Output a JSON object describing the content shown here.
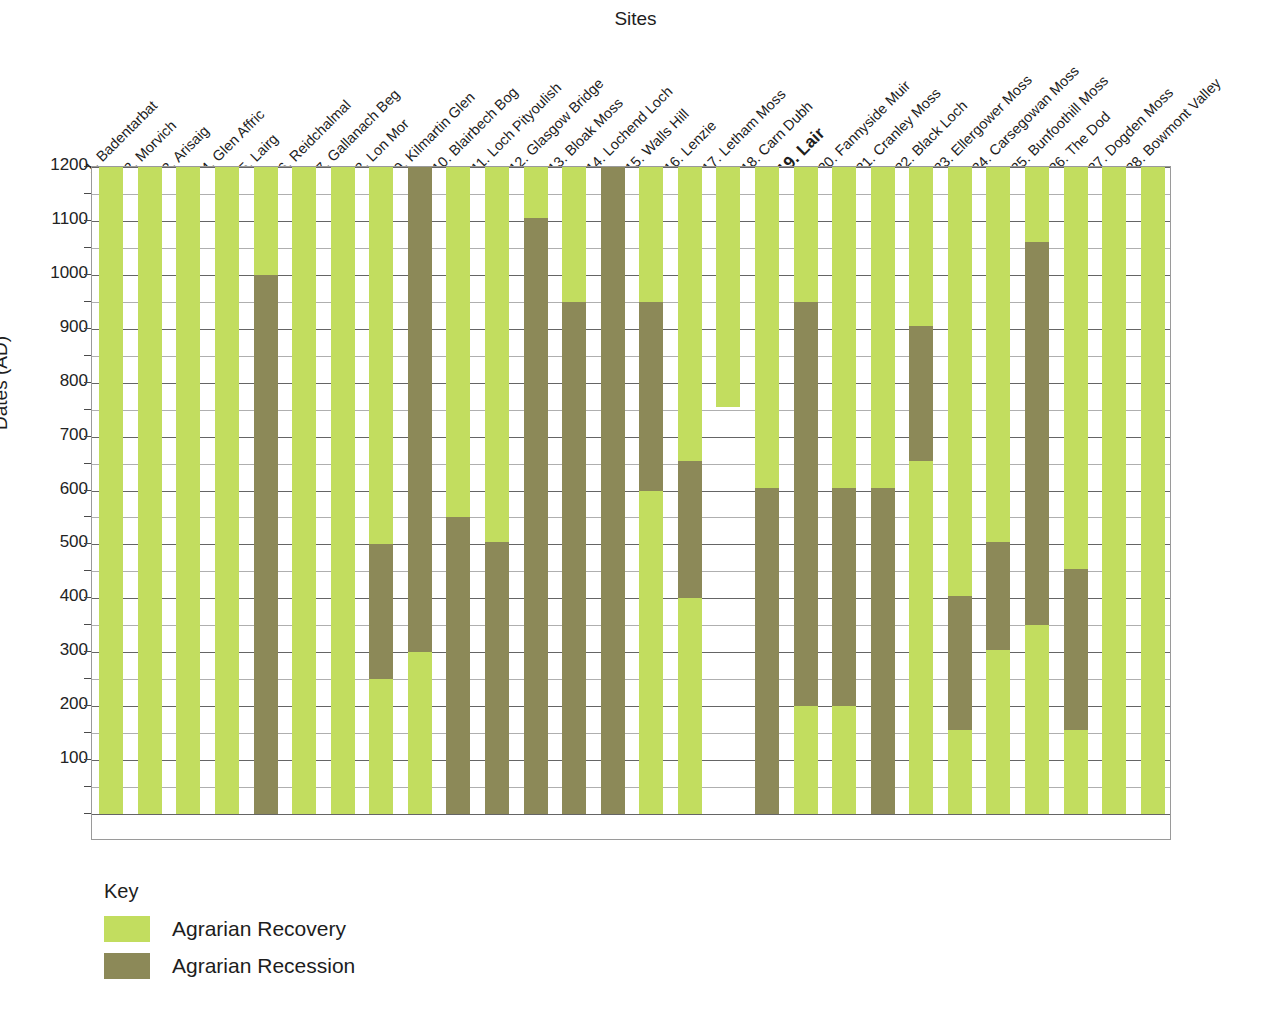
{
  "chart_data": {
    "type": "bar",
    "title": "Sites",
    "xlabel": "Sites",
    "ylabel": "Dates (AD)",
    "ylim": [
      0,
      1200
    ],
    "y_major_ticks": [
      1200,
      1100,
      1000,
      900,
      800,
      700,
      600,
      500,
      400,
      300,
      200,
      100
    ],
    "y_minor_step": 50,
    "grid": true,
    "legend_position": "below-plot-left",
    "colors": {
      "recovery": "#c2dd5f",
      "recession": "#8c8958"
    },
    "categories": [
      "1. Badentarbat",
      "2. Morvich",
      "3. Arisaig",
      "4. Glen Affric",
      "5. Lairg",
      "6. Reidchalmal",
      "7. Gallanach Beg",
      "8. Lon Mor",
      "9. Kilmartin Glen",
      "10. Blairbech Bog",
      "11. Loch Pityoulish",
      "12. Glasgow Bridge",
      "13. Bloak Moss",
      "14. Lochend Loch",
      "15. Walls Hill",
      "16. Lenzie",
      "17. Letham Moss",
      "18. Carn Dubh",
      "19. Lair",
      "20. Fannyside Muir",
      "21. Cranley Moss",
      "22. Black Loch",
      "23. Ellergower Moss",
      "24. Carsegowan Moss",
      "25. Bunfoothill Moss",
      "26. The Dod",
      "27. Dogden Moss",
      "28. Bowmont Valley"
    ],
    "highlighted_category": "19. Lair",
    "series": [
      {
        "name": "Agrarian Recovery",
        "color": "#c2dd5f"
      },
      {
        "name": "Agrarian Recession",
        "color": "#8c8958"
      }
    ],
    "bars": [
      {
        "site": "1. Badentarbat",
        "segments": [
          {
            "type": "recovery",
            "from": 0,
            "to": 1200
          }
        ]
      },
      {
        "site": "2. Morvich",
        "segments": [
          {
            "type": "recovery",
            "from": 0,
            "to": 1200
          }
        ]
      },
      {
        "site": "3. Arisaig",
        "segments": [
          {
            "type": "recovery",
            "from": 0,
            "to": 1200
          }
        ]
      },
      {
        "site": "4. Glen Affric",
        "segments": [
          {
            "type": "recovery",
            "from": 0,
            "to": 1200
          }
        ]
      },
      {
        "site": "5. Lairg",
        "segments": [
          {
            "type": "recession",
            "from": 0,
            "to": 1000
          },
          {
            "type": "recovery",
            "from": 1000,
            "to": 1200
          }
        ]
      },
      {
        "site": "6. Reidchalmal",
        "segments": [
          {
            "type": "recovery",
            "from": 0,
            "to": 1200
          }
        ]
      },
      {
        "site": "7. Gallanach Beg",
        "segments": [
          {
            "type": "recovery",
            "from": 0,
            "to": 1200
          }
        ]
      },
      {
        "site": "8. Lon Mor",
        "segments": [
          {
            "type": "recovery",
            "from": 0,
            "to": 250
          },
          {
            "type": "recession",
            "from": 250,
            "to": 500
          },
          {
            "type": "recovery",
            "from": 500,
            "to": 1200
          }
        ]
      },
      {
        "site": "9. Kilmartin Glen",
        "segments": [
          {
            "type": "recovery",
            "from": 0,
            "to": 300
          },
          {
            "type": "recession",
            "from": 300,
            "to": 1200
          }
        ]
      },
      {
        "site": "10. Blairbech Bog",
        "segments": [
          {
            "type": "recession",
            "from": 0,
            "to": 550
          },
          {
            "type": "recovery",
            "from": 550,
            "to": 1200
          }
        ]
      },
      {
        "site": "11. Loch Pityoulish",
        "segments": [
          {
            "type": "recession",
            "from": 0,
            "to": 505
          },
          {
            "type": "recovery",
            "from": 505,
            "to": 1200
          }
        ]
      },
      {
        "site": "12. Glasgow Bridge",
        "segments": [
          {
            "type": "recession",
            "from": 0,
            "to": 1105
          },
          {
            "type": "recovery",
            "from": 1105,
            "to": 1200
          }
        ]
      },
      {
        "site": "13. Bloak Moss",
        "segments": [
          {
            "type": "recession",
            "from": 0,
            "to": 950
          },
          {
            "type": "recovery",
            "from": 950,
            "to": 1200
          }
        ]
      },
      {
        "site": "14. Lochend Loch",
        "segments": [
          {
            "type": "recession",
            "from": 0,
            "to": 1200
          }
        ]
      },
      {
        "site": "15. Walls Hill",
        "segments": [
          {
            "type": "recovery",
            "from": 0,
            "to": 600
          },
          {
            "type": "recession",
            "from": 600,
            "to": 950
          },
          {
            "type": "recovery",
            "from": 950,
            "to": 1200
          }
        ]
      },
      {
        "site": "16. Lenzie",
        "segments": [
          {
            "type": "recovery",
            "from": 0,
            "to": 400
          },
          {
            "type": "recession",
            "from": 400,
            "to": 655
          },
          {
            "type": "recovery",
            "from": 655,
            "to": 1200
          }
        ]
      },
      {
        "site": "17. Letham Moss",
        "segments": [
          {
            "type": "recovery",
            "from": 755,
            "to": 1200
          }
        ]
      },
      {
        "site": "18. Carn Dubh",
        "segments": [
          {
            "type": "recession",
            "from": 0,
            "to": 605
          },
          {
            "type": "recovery",
            "from": 605,
            "to": 1200
          }
        ]
      },
      {
        "site": "19. Lair",
        "segments": [
          {
            "type": "recovery",
            "from": 0,
            "to": 200
          },
          {
            "type": "recession",
            "from": 200,
            "to": 950
          },
          {
            "type": "recovery",
            "from": 950,
            "to": 1200
          }
        ]
      },
      {
        "site": "20. Fannyside Muir",
        "segments": [
          {
            "type": "recovery",
            "from": 0,
            "to": 200
          },
          {
            "type": "recession",
            "from": 200,
            "to": 605
          },
          {
            "type": "recovery",
            "from": 605,
            "to": 1200
          }
        ]
      },
      {
        "site": "21. Cranley Moss",
        "segments": [
          {
            "type": "recession",
            "from": 0,
            "to": 605
          },
          {
            "type": "recovery",
            "from": 605,
            "to": 1200
          }
        ]
      },
      {
        "site": "22. Black Loch",
        "segments": [
          {
            "type": "recovery",
            "from": 0,
            "to": 655
          },
          {
            "type": "recession",
            "from": 655,
            "to": 905
          },
          {
            "type": "recovery",
            "from": 905,
            "to": 1200
          }
        ]
      },
      {
        "site": "23. Ellergower Moss",
        "segments": [
          {
            "type": "recovery",
            "from": 0,
            "to": 155
          },
          {
            "type": "recession",
            "from": 155,
            "to": 405
          },
          {
            "type": "recovery",
            "from": 405,
            "to": 1200
          }
        ]
      },
      {
        "site": "24. Carsegowan Moss",
        "segments": [
          {
            "type": "recovery",
            "from": 0,
            "to": 305
          },
          {
            "type": "recession",
            "from": 305,
            "to": 505
          },
          {
            "type": "recovery",
            "from": 505,
            "to": 1200
          }
        ]
      },
      {
        "site": "25. Bunfoothill Moss",
        "segments": [
          {
            "type": "recovery",
            "from": 0,
            "to": 350
          },
          {
            "type": "recession",
            "from": 350,
            "to": 1060
          },
          {
            "type": "recovery",
            "from": 1060,
            "to": 1200
          }
        ]
      },
      {
        "site": "26. The Dod",
        "segments": [
          {
            "type": "recovery",
            "from": 0,
            "to": 155
          },
          {
            "type": "recession",
            "from": 155,
            "to": 455
          },
          {
            "type": "recovery",
            "from": 455,
            "to": 1200
          }
        ]
      },
      {
        "site": "27. Dogden Moss",
        "segments": [
          {
            "type": "recovery",
            "from": 0,
            "to": 1200
          }
        ]
      },
      {
        "site": "28. Bowmont Valley",
        "segments": [
          {
            "type": "recovery",
            "from": 0,
            "to": 1200
          }
        ]
      }
    ]
  },
  "key": {
    "title": "Key",
    "items": [
      {
        "label": "Agrarian Recovery",
        "type": "recovery"
      },
      {
        "label": "Agrarian Recession",
        "type": "recession"
      }
    ]
  },
  "footnote": ""
}
